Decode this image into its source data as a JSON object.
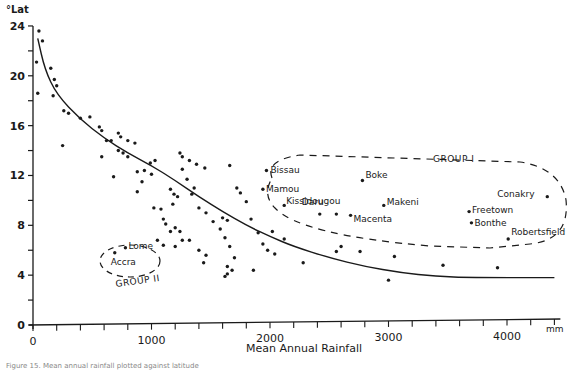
{
  "chart_data": {
    "type": "scatter",
    "title": "",
    "xlabel": "Mean Annual Rainfall",
    "x_unit": "mm",
    "ylabel": "°Lat",
    "xlim": [
      0,
      4400
    ],
    "ylim": [
      0,
      24
    ],
    "x_ticks": [
      0,
      1000,
      2000,
      3000,
      4000
    ],
    "x_minor_step": 200,
    "y_ticks": [
      0,
      4,
      8,
      12,
      16,
      20,
      24
    ],
    "y_minor_step": 2,
    "grid": false,
    "legend": null,
    "trend_curve": {
      "description": "hand-fitted decreasing curve, latitude vs rainfall",
      "points": [
        [
          40,
          23.0
        ],
        [
          100,
          20.5
        ],
        [
          200,
          18.5
        ],
        [
          400,
          16.5
        ],
        [
          600,
          15.0
        ],
        [
          800,
          13.8
        ],
        [
          1000,
          12.8
        ],
        [
          1200,
          11.6
        ],
        [
          1400,
          10.3
        ],
        [
          1600,
          9.1
        ],
        [
          1800,
          8.0
        ],
        [
          2000,
          7.1
        ],
        [
          2200,
          6.3
        ],
        [
          2500,
          5.4
        ],
        [
          2800,
          4.7
        ],
        [
          3100,
          4.2
        ],
        [
          3400,
          3.9
        ],
        [
          3700,
          3.8
        ],
        [
          4400,
          3.8
        ]
      ]
    },
    "series": [
      {
        "name": "Stations (ungrouped)",
        "points": [
          [
            50,
            23.6
          ],
          [
            80,
            22.8
          ],
          [
            30,
            21.1
          ],
          [
            150,
            20.6
          ],
          [
            180,
            19.7
          ],
          [
            200,
            19.2
          ],
          [
            40,
            18.6
          ],
          [
            170,
            18.4
          ],
          [
            260,
            17.2
          ],
          [
            300,
            17.0
          ],
          [
            400,
            16.6
          ],
          [
            480,
            16.7
          ],
          [
            560,
            15.9
          ],
          [
            580,
            15.6
          ],
          [
            620,
            14.8
          ],
          [
            660,
            14.8
          ],
          [
            250,
            14.4
          ],
          [
            720,
            15.4
          ],
          [
            740,
            15.1
          ],
          [
            800,
            14.8
          ],
          [
            860,
            14.6
          ],
          [
            720,
            14.0
          ],
          [
            760,
            13.8
          ],
          [
            580,
            13.5
          ],
          [
            800,
            13.5
          ],
          [
            990,
            13.0
          ],
          [
            1030,
            13.2
          ],
          [
            680,
            11.9
          ],
          [
            880,
            12.3
          ],
          [
            940,
            12.4
          ],
          [
            1000,
            12.1
          ],
          [
            920,
            11.5
          ],
          [
            880,
            10.7
          ],
          [
            1240,
            13.8
          ],
          [
            1260,
            13.5
          ],
          [
            1320,
            13.2
          ],
          [
            1380,
            12.9
          ],
          [
            1450,
            12.6
          ],
          [
            1260,
            12.5
          ],
          [
            1300,
            11.7
          ],
          [
            1360,
            11.0
          ],
          [
            1160,
            10.9
          ],
          [
            1190,
            10.5
          ],
          [
            1220,
            10.3
          ],
          [
            1180,
            9.7
          ],
          [
            1020,
            9.4
          ],
          [
            1080,
            9.3
          ],
          [
            1340,
            10.5
          ],
          [
            1400,
            9.4
          ],
          [
            1460,
            9.0
          ],
          [
            1520,
            8.3
          ],
          [
            1100,
            8.5
          ],
          [
            1120,
            8.1
          ],
          [
            1160,
            7.5
          ],
          [
            1200,
            7.8
          ],
          [
            1240,
            7.5
          ],
          [
            1260,
            6.8
          ],
          [
            1050,
            6.8
          ],
          [
            1100,
            6.4
          ],
          [
            1200,
            6.3
          ],
          [
            1320,
            6.8
          ],
          [
            1400,
            6.0
          ],
          [
            1460,
            5.6
          ],
          [
            1440,
            5.0
          ],
          [
            1600,
            8.6
          ],
          [
            1640,
            8.4
          ],
          [
            1580,
            7.7
          ],
          [
            1620,
            7.0
          ],
          [
            1660,
            6.3
          ],
          [
            1700,
            5.4
          ],
          [
            1750,
            10.6
          ],
          [
            1840,
            8.5
          ],
          [
            1660,
            12.8
          ],
          [
            1720,
            11.0
          ],
          [
            1800,
            9.9
          ],
          [
            1640,
            4.7
          ],
          [
            1640,
            4.1
          ],
          [
            1680,
            4.4
          ],
          [
            1620,
            3.9
          ],
          [
            1860,
            4.4
          ],
          [
            1900,
            7.4
          ],
          [
            1940,
            6.5
          ],
          [
            1980,
            6.0
          ],
          [
            2040,
            5.7
          ],
          [
            2020,
            7.5
          ],
          [
            2120,
            6.9
          ],
          [
            2280,
            5.0
          ],
          [
            2560,
            5.9
          ],
          [
            2600,
            6.3
          ],
          [
            2760,
            5.9
          ],
          [
            3050,
            5.5
          ],
          [
            3000,
            3.6
          ],
          [
            3460,
            4.8
          ],
          [
            3920,
            4.6
          ]
        ]
      },
      {
        "name": "Group I",
        "points": [
          {
            "label": "Bissau",
            "x": 1970,
            "y": 12.4
          },
          {
            "label": "Mamou",
            "x": 1940,
            "y": 10.9
          },
          {
            "label": "Kissidougou",
            "x": 2120,
            "y": 9.6
          },
          {
            "label": "Boke",
            "x": 2780,
            "y": 11.6
          },
          {
            "label": "Daru",
            "x": 2420,
            "y": 8.9
          },
          {
            "label": "Macenta",
            "x": 2680,
            "y": 8.8
          },
          {
            "label": "Makeni",
            "x": 2960,
            "y": 9.6
          },
          {
            "label": "Freetown",
            "x": 3680,
            "y": 9.1
          },
          {
            "label": "Bonthe",
            "x": 3700,
            "y": 8.2
          },
          {
            "label": "Conakry",
            "x": 4340,
            "y": 10.3
          },
          {
            "label": "Robertsfield",
            "x": 4010,
            "y": 6.9
          },
          {
            "label": "",
            "x": 2560,
            "y": 8.9
          }
        ]
      },
      {
        "name": "Group II",
        "points": [
          {
            "label": "Lome",
            "x": 780,
            "y": 6.2
          },
          {
            "label": "Accra",
            "x": 690,
            "y": 5.8
          }
        ]
      }
    ],
    "annotations": [
      {
        "text": "GROUP I",
        "x": 3200,
        "y": 13.0
      },
      {
        "text": "GROUP II",
        "x": 760,
        "y": 3.5
      }
    ]
  },
  "labels": {
    "y_axis_unit": "°Lat",
    "x_axis_title": "Mean Annual Rainfall",
    "x_axis_unit": "mm",
    "group1": "GROUP I",
    "group2": "GROUP II",
    "caption": "Figure 15. Mean annual rainfall plotted against latitude"
  },
  "style": {
    "ink": "#1a1a1a",
    "background": "#ffffff"
  }
}
